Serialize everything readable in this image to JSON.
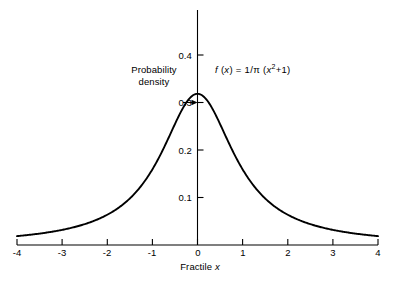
{
  "chart_data": {
    "type": "line",
    "title": "",
    "subtitle": "",
    "xlabel": "Fractile x",
    "ylabel": "Probability density",
    "annotation_formula": "f (x) = 1/π (x²+1)",
    "formula_parts": {
      "f": "f",
      "open_arg": " (",
      "x1": "x",
      "close_arg": ")",
      "equals": " = 1/",
      "pi": "π",
      "open2": " (",
      "x2": "x",
      "sq": "2",
      "plus_one": "+1)"
    },
    "xlim": [
      -4,
      4
    ],
    "ylim": [
      0,
      0.42
    ],
    "grid": false,
    "legend": "none",
    "xticks": [
      "-4",
      "-3",
      "-2",
      "-1",
      "0",
      "1",
      "2",
      "3",
      "4"
    ],
    "xtick_values": [
      -4,
      -3,
      -2,
      -1,
      0,
      1,
      2,
      3,
      4
    ],
    "yticks": [
      "0.1",
      "0.2",
      "0.3",
      "0.4"
    ],
    "ytick_values": [
      0.1,
      0.2,
      0.3,
      0.4
    ],
    "series": [
      {
        "name": "Cauchy density",
        "color": "#000000",
        "x": [
          -4,
          -3.8,
          -3.6,
          -3.4,
          -3.2,
          -3,
          -2.8,
          -2.6,
          -2.4,
          -2.2,
          -2,
          -1.8,
          -1.6,
          -1.4,
          -1.2,
          -1,
          -0.8,
          -0.6,
          -0.4,
          -0.2,
          0,
          0.2,
          0.4,
          0.6,
          0.8,
          1,
          1.2,
          1.4,
          1.6,
          1.8,
          2,
          2.2,
          2.4,
          2.6,
          2.8,
          3,
          3.2,
          3.4,
          3.6,
          3.8,
          4
        ],
        "values": [
          0.0187,
          0.0206,
          0.0228,
          0.0253,
          0.0282,
          0.0318,
          0.036,
          0.0411,
          0.0473,
          0.0551,
          0.0637,
          0.0751,
          0.0894,
          0.1075,
          0.1306,
          0.1592,
          0.1941,
          0.2342,
          0.2744,
          0.3061,
          0.3183,
          0.3061,
          0.2744,
          0.2342,
          0.1941,
          0.1592,
          0.1306,
          0.1075,
          0.0894,
          0.0751,
          0.0637,
          0.0551,
          0.0473,
          0.0411,
          0.036,
          0.0318,
          0.0282,
          0.0253,
          0.0228,
          0.0206,
          0.0187
        ]
      }
    ],
    "annotations": [
      {
        "name": "peak-arrow",
        "text": "",
        "points_to_x": 0,
        "points_to_y": 0.3183,
        "description": "short horizontal arrow from the 0.3 tick label toward the curve peak at 1/pi"
      }
    ],
    "peak_value": 0.3183,
    "peak_x": 0
  },
  "axis_labels": {
    "y_title_line1": "Probability",
    "y_title_line2": "density",
    "x_title_prefix": "Fractile ",
    "x_title_var": "x"
  }
}
